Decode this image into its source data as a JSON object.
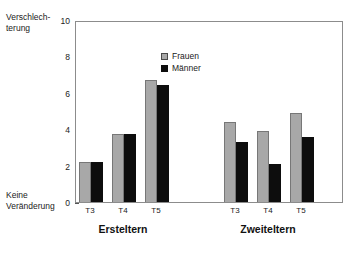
{
  "chart_data": {
    "type": "bar",
    "title": "",
    "xlabel": "",
    "ylabel": "",
    "ylim": [
      0,
      10
    ],
    "yticks": [
      0,
      2,
      4,
      6,
      8,
      10
    ],
    "ytick_labels": [
      "0",
      "2",
      "4",
      "6",
      "8",
      "10"
    ],
    "axis_top_label": "Verschlech-\nterung",
    "axis_top_label_line1": "Verschlech-",
    "axis_top_label_line2": "terung",
    "axis_bottom_label_line1": "Keine",
    "axis_bottom_label_line2": "Veränderung",
    "grid": false,
    "legend_position": "top-left-inside",
    "categories": [
      "T3",
      "T4",
      "T5",
      "T3",
      "T4",
      "T5"
    ],
    "groups": [
      {
        "name": "Ersteltern",
        "categories": [
          "T3",
          "T4",
          "T5"
        ],
        "series": [
          {
            "name": "Frauen",
            "values": [
              2.2,
              3.75,
              6.7
            ]
          },
          {
            "name": "Männer",
            "values": [
              2.2,
              3.75,
              6.45
            ]
          }
        ]
      },
      {
        "name": "Zweiteltern",
        "categories": [
          "T3",
          "T4",
          "T5"
        ],
        "series": [
          {
            "name": "Frauen",
            "values": [
              4.4,
              3.9,
              4.9
            ]
          },
          {
            "name": "Männer",
            "values": [
              3.3,
              2.1,
              3.55
            ]
          }
        ]
      }
    ],
    "series": [
      {
        "name": "Frauen",
        "color": "#a8a8a8",
        "values": [
          2.2,
          3.75,
          6.7,
          4.4,
          3.9,
          4.9
        ]
      },
      {
        "name": "Männer",
        "color": "#0d0d0d",
        "values": [
          2.2,
          3.75,
          6.45,
          3.3,
          2.1,
          3.55
        ]
      }
    ]
  },
  "legend": {
    "items": [
      {
        "label": "Frauen",
        "color": "#a8a8a8"
      },
      {
        "label": "Männer",
        "color": "#0d0d0d"
      }
    ]
  },
  "colors": {
    "frauen": "#a8a8a8",
    "maenner": "#0d0d0d",
    "frame": "#8c8c8c",
    "text": "#1a1a1a"
  }
}
